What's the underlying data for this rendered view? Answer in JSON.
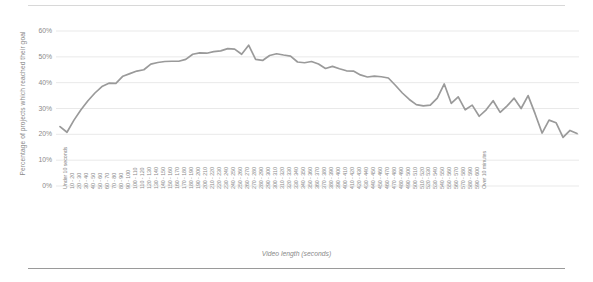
{
  "chart_data": {
    "type": "line",
    "title": "",
    "xlabel": "Video length (seconds)",
    "ylabel": "Percentage of projects which reached their goal",
    "ylim": [
      0,
      60
    ],
    "yticks": [
      "0%",
      "10%",
      "20%",
      "30%",
      "40%",
      "50%",
      "60%"
    ],
    "ytick_values": [
      0,
      10,
      20,
      30,
      40,
      50,
      60
    ],
    "grid": true,
    "legend": false,
    "line_color": "#9a9a9a",
    "categories": [
      "Under 10 seconds",
      "10 - 20",
      "20 - 30",
      "30 - 40",
      "40 - 50",
      "50 - 60",
      "60 - 70",
      "70 - 80",
      "80 - 90",
      "90 - 100",
      "100 - 110",
      "110 - 120",
      "120 - 130",
      "130 - 140",
      "140 - 150",
      "150 - 160",
      "160 - 170",
      "170 - 180",
      "180 - 190",
      "190 - 200",
      "200 - 210",
      "210 - 220",
      "220 - 230",
      "230 - 240",
      "240 - 250",
      "250 - 260",
      "260 - 270",
      "270 - 280",
      "280 - 290",
      "290 - 300",
      "300 - 310",
      "310 - 320",
      "320 - 330",
      "330 - 340",
      "340 - 350",
      "350 - 360",
      "360 - 370",
      "370 - 380",
      "380 - 390",
      "390 - 400",
      "400 - 410",
      "410 - 420",
      "420 - 430",
      "430 - 440",
      "440 - 450",
      "450 - 460",
      "460 - 470",
      "470 - 480",
      "480 - 490",
      "490 - 500",
      "500 - 510",
      "510 - 520",
      "520 - 530",
      "530 - 540",
      "540 - 550",
      "550 - 560",
      "560 - 570",
      "570 - 580",
      "580 - 590",
      "590 - 600",
      "Over 10 minutes"
    ],
    "values": [
      23.0,
      20.8,
      25.5,
      29.5,
      33.0,
      36.0,
      38.5,
      39.8,
      39.7,
      42.5,
      43.5,
      44.5,
      45.0,
      47.2,
      47.8,
      48.2,
      48.3,
      48.3,
      49.0,
      51.0,
      51.5,
      51.4,
      52.0,
      52.3,
      53.2,
      53.0,
      51.0,
      54.5,
      49.0,
      48.6,
      50.5,
      51.2,
      50.7,
      50.3,
      48.0,
      47.7,
      48.2,
      47.2,
      45.5,
      46.3,
      45.4,
      44.6,
      44.5,
      43.0,
      42.2,
      42.5,
      42.3,
      41.8,
      39.0,
      36.0,
      33.5,
      31.5,
      31.0,
      31.3,
      34.0,
      39.5,
      32.0,
      34.5,
      29.5,
      31.3,
      27.0
    ],
    "values_extra": [
      29.5,
      33.0,
      28.5,
      31.0,
      34.0,
      30.0,
      35.0,
      28.0,
      20.5,
      25.5,
      24.5,
      18.8,
      21.5,
      20.3
    ]
  }
}
